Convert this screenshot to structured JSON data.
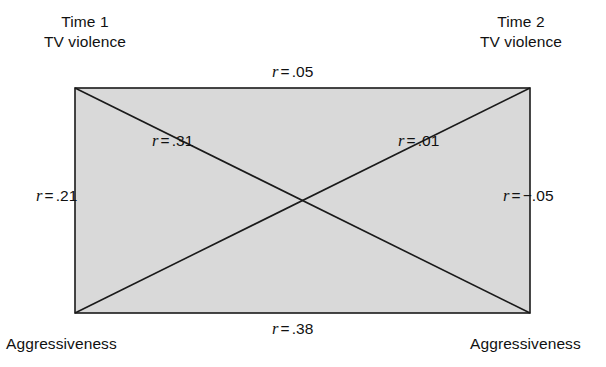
{
  "diagram": {
    "type": "cross-lagged-panel-correlation",
    "panel": {
      "fill_color": "#d9d9d9",
      "stroke_color": "#1a1a1a",
      "x": 75,
      "y": 88,
      "width": 455,
      "height": 225
    },
    "corners": {
      "top_left": {
        "line1": "Time 1",
        "line2": "TV violence"
      },
      "top_right": {
        "line1": "Time 2",
        "line2": "TV violence"
      },
      "bottom_left": {
        "label": "Aggressiveness"
      },
      "bottom_right": {
        "label": "Aggressiveness"
      }
    },
    "correlations": [
      {
        "id": "top",
        "symbol": "r",
        "operator": "=",
        "value": ".05",
        "path": "Time 1 TV violence – Time 2 TV violence"
      },
      {
        "id": "bottom",
        "symbol": "r",
        "operator": "=",
        "value": ".38",
        "path": "Aggressiveness Time 1 – Aggressiveness Time 2"
      },
      {
        "id": "left",
        "symbol": "r",
        "operator": "=",
        "value": ".21",
        "path": "Time 1 TV violence – Time 1 Aggressiveness"
      },
      {
        "id": "right",
        "symbol": "r",
        "operator": "=",
        "value": "−.05",
        "path": "Time 2 TV violence – Time 2 Aggressiveness"
      },
      {
        "id": "diag-tl-br",
        "symbol": "r",
        "operator": "=",
        "value": ".31",
        "path": "Time 1 TV violence – Time 2 Aggressiveness"
      },
      {
        "id": "diag-bl-tr",
        "symbol": "r",
        "operator": "=",
        "value": ".01",
        "path": "Time 1 Aggressiveness – Time 2 TV violence"
      }
    ]
  }
}
